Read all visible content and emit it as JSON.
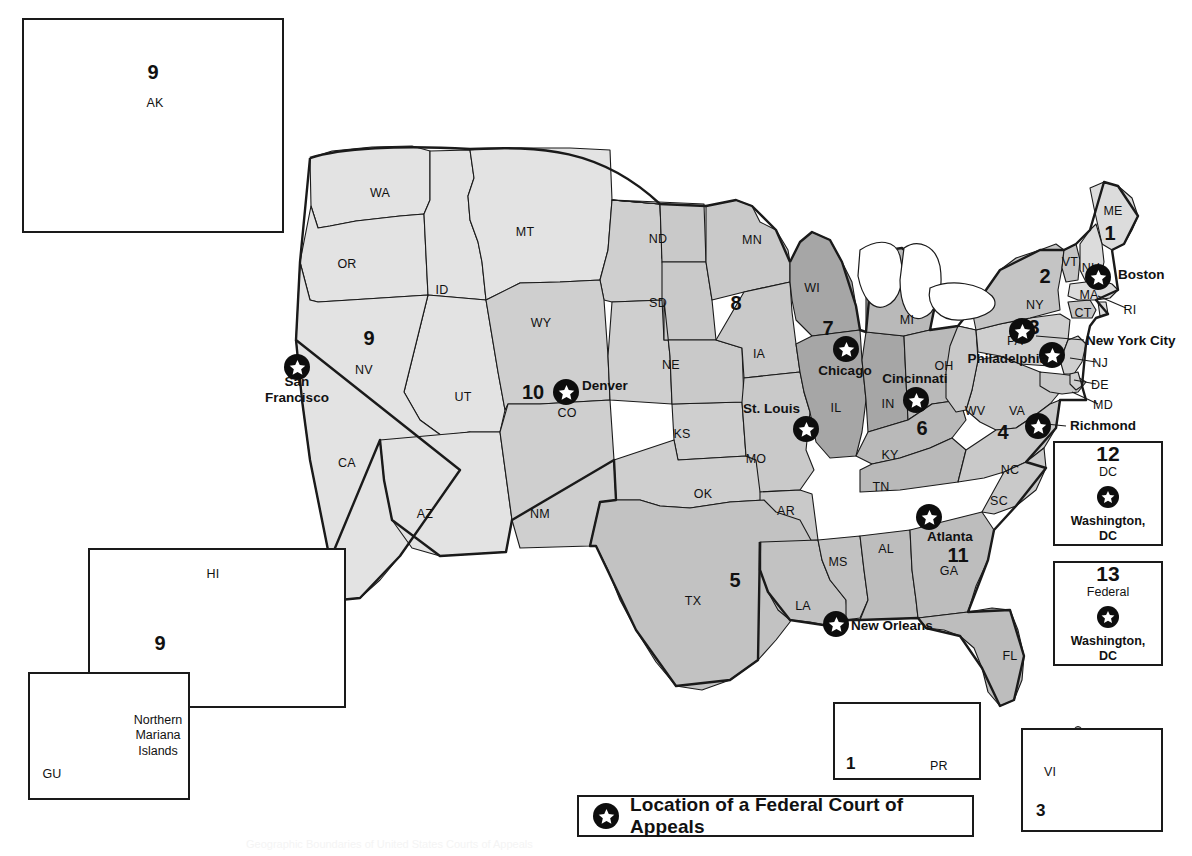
{
  "title": "Geographic Boundaries of United States Courts of Appeals",
  "legend": {
    "icon": "star-in-circle-icon",
    "label": "Location of a Federal Court of Appeals"
  },
  "colors": {
    "circuit_light": "#e3e3e3",
    "circuit_medium_light": "#cccccc",
    "circuit_medium": "#bdbdbd",
    "circuit_dark": "#a6a6a6",
    "outline": "#1a1a1a",
    "marker": "#0d0d0d",
    "star_fill": "#ffffff",
    "background": "#ffffff"
  },
  "states": [
    {
      "abbr": "WA",
      "x": 380,
      "y": 193
    },
    {
      "abbr": "OR",
      "x": 347,
      "y": 264
    },
    {
      "abbr": "ID",
      "x": 442,
      "y": 290
    },
    {
      "abbr": "MT",
      "x": 525,
      "y": 232
    },
    {
      "abbr": "WY",
      "x": 541,
      "y": 323
    },
    {
      "abbr": "NV",
      "x": 364,
      "y": 370
    },
    {
      "abbr": "CA",
      "x": 347,
      "y": 463
    },
    {
      "abbr": "UT",
      "x": 463,
      "y": 397
    },
    {
      "abbr": "CO",
      "x": 567,
      "y": 413
    },
    {
      "abbr": "AZ",
      "x": 425,
      "y": 514
    },
    {
      "abbr": "NM",
      "x": 540,
      "y": 514
    },
    {
      "abbr": "ND",
      "x": 658,
      "y": 239
    },
    {
      "abbr": "SD",
      "x": 658,
      "y": 303
    },
    {
      "abbr": "NE",
      "x": 671,
      "y": 365
    },
    {
      "abbr": "KS",
      "x": 682,
      "y": 434
    },
    {
      "abbr": "OK",
      "x": 703,
      "y": 494
    },
    {
      "abbr": "TX",
      "x": 693,
      "y": 601
    },
    {
      "abbr": "MN",
      "x": 752,
      "y": 240
    },
    {
      "abbr": "IA",
      "x": 759,
      "y": 354
    },
    {
      "abbr": "MO",
      "x": 756,
      "y": 459
    },
    {
      "abbr": "AR",
      "x": 786,
      "y": 511
    },
    {
      "abbr": "LA",
      "x": 803,
      "y": 606
    },
    {
      "abbr": "MS",
      "x": 838,
      "y": 562
    },
    {
      "abbr": "AL",
      "x": 886,
      "y": 549
    },
    {
      "abbr": "WI",
      "x": 812,
      "y": 288
    },
    {
      "abbr": "IL",
      "x": 836,
      "y": 408
    },
    {
      "abbr": "IN",
      "x": 888,
      "y": 404
    },
    {
      "abbr": "MI",
      "x": 907,
      "y": 320
    },
    {
      "abbr": "OH",
      "x": 944,
      "y": 366
    },
    {
      "abbr": "KY",
      "x": 890,
      "y": 455
    },
    {
      "abbr": "TN",
      "x": 881,
      "y": 487
    },
    {
      "abbr": "WV",
      "x": 975,
      "y": 411
    },
    {
      "abbr": "VA",
      "x": 1017,
      "y": 411
    },
    {
      "abbr": "NC",
      "x": 1010,
      "y": 470
    },
    {
      "abbr": "SC",
      "x": 999,
      "y": 501
    },
    {
      "abbr": "GA",
      "x": 949,
      "y": 571
    },
    {
      "abbr": "FL",
      "x": 1010,
      "y": 656
    },
    {
      "abbr": "PA",
      "x": 1015,
      "y": 341
    },
    {
      "abbr": "NY",
      "x": 1035,
      "y": 305
    },
    {
      "abbr": "VT",
      "x": 1070,
      "y": 262
    },
    {
      "abbr": "NH",
      "x": 1091,
      "y": 268
    },
    {
      "abbr": "ME",
      "x": 1113,
      "y": 211
    },
    {
      "abbr": "MA",
      "x": 1089,
      "y": 295
    },
    {
      "abbr": "RI",
      "x": 1130,
      "y": 310
    },
    {
      "abbr": "CT",
      "x": 1083,
      "y": 313
    },
    {
      "abbr": "NJ",
      "x": 1100,
      "y": 363
    },
    {
      "abbr": "DE",
      "x": 1100,
      "y": 385
    },
    {
      "abbr": "MD",
      "x": 1103,
      "y": 405
    }
  ],
  "circuit_numbers": [
    {
      "number": "9",
      "x": 369,
      "y": 338
    },
    {
      "number": "10",
      "x": 533,
      "y": 392
    },
    {
      "number": "8",
      "x": 736,
      "y": 303
    },
    {
      "number": "7",
      "x": 828,
      "y": 328
    },
    {
      "number": "5",
      "x": 735,
      "y": 580
    },
    {
      "number": "6",
      "x": 922,
      "y": 428
    },
    {
      "number": "4",
      "x": 1003,
      "y": 432
    },
    {
      "number": "3",
      "x": 1034,
      "y": 327
    },
    {
      "number": "2",
      "x": 1045,
      "y": 276
    },
    {
      "number": "1",
      "x": 1110,
      "y": 233
    },
    {
      "number": "11",
      "x": 958,
      "y": 555
    }
  ],
  "court_locations": [
    {
      "city": "San Francisco",
      "x": 297,
      "y": 367,
      "label_x": 297,
      "label_y": 390,
      "align": "center",
      "multiline": true,
      "line1": "San",
      "line2": "Francisco"
    },
    {
      "city": "Denver",
      "x": 566,
      "y": 392,
      "label_x": 582,
      "label_y": 386,
      "align": "left"
    },
    {
      "city": "St. Louis",
      "x": 806,
      "y": 429,
      "label_x": 800,
      "label_y": 409,
      "align": "right"
    },
    {
      "city": "Chicago",
      "x": 846,
      "y": 349,
      "label_x": 845,
      "label_y": 371,
      "align": "center"
    },
    {
      "city": "Cincinnati",
      "x": 916,
      "y": 400,
      "label_x": 915,
      "label_y": 379,
      "align": "center"
    },
    {
      "city": "New Orleans",
      "x": 836,
      "y": 624,
      "label_x": 851,
      "label_y": 626,
      "align": "left"
    },
    {
      "city": "Atlanta",
      "x": 929,
      "y": 517,
      "label_x": 950,
      "label_y": 537,
      "align": "center"
    },
    {
      "city": "Richmond",
      "x": 1038,
      "y": 426,
      "label_x": 1070,
      "label_y": 426,
      "align": "left"
    },
    {
      "city": "Philadelphia",
      "x": 1052,
      "y": 355,
      "label_x": 1047,
      "label_y": 359,
      "align": "right"
    },
    {
      "city": "New York City",
      "x": 1022,
      "y": 331,
      "label_x": 1086,
      "label_y": 341,
      "align": "left"
    },
    {
      "city": "Boston",
      "x": 1098,
      "y": 277,
      "label_x": 1118,
      "label_y": 275,
      "align": "left"
    }
  ],
  "insets": {
    "alaska": {
      "number": "9",
      "abbr": "AK"
    },
    "hawaii": {
      "number": "9",
      "abbr": "HI"
    },
    "guam": {
      "abbr": "GU",
      "name": "Northern Mariana Islands"
    },
    "puerto_rico": {
      "number": "1",
      "abbr": "PR"
    },
    "virgin_islands": {
      "number": "3",
      "abbr": "VI"
    }
  },
  "dc_boxes": [
    {
      "number": "12",
      "sub": "DC",
      "place_line1": "Washington,",
      "place_line2": "DC",
      "icon": "star-in-circle-icon"
    },
    {
      "number": "13",
      "sub": "Federal",
      "place_line1": "Washington,",
      "place_line2": "DC",
      "icon": "star-in-circle-icon"
    }
  ]
}
